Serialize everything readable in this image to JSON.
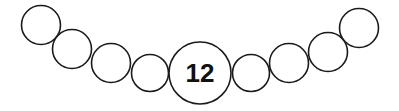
{
  "diagram": {
    "center_label": "12",
    "stroke_color": "#1a1a1a",
    "background": "#ffffff",
    "circles": [
      {
        "cx": 41,
        "cy": 25,
        "r": 19.5
      },
      {
        "cx": 72,
        "cy": 49,
        "r": 19.5
      },
      {
        "cx": 111,
        "cy": 63,
        "r": 19.5
      },
      {
        "cx": 150,
        "cy": 73,
        "r": 18.5
      },
      {
        "cx": 251,
        "cy": 73,
        "r": 18.5
      },
      {
        "cx": 289,
        "cy": 63,
        "r": 19.5
      },
      {
        "cx": 328,
        "cy": 52,
        "r": 19.5
      },
      {
        "cx": 359,
        "cy": 28,
        "r": 19.5
      }
    ],
    "center_circle": {
      "cx": 200,
      "cy": 73,
      "r": 31
    }
  }
}
